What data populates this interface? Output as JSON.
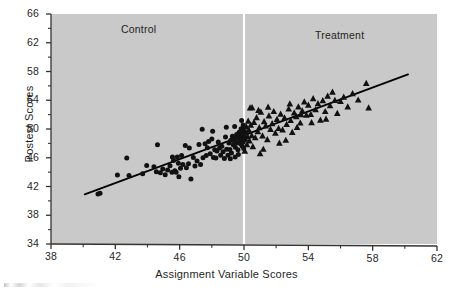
{
  "chart_data": {
    "type": "scatter",
    "title": "",
    "xlabel": "Assignment Variable Scores",
    "ylabel": "Postest Scores",
    "xlim": [
      38,
      62
    ],
    "ylim": [
      34,
      66
    ],
    "xticks": [
      38,
      42,
      46,
      50,
      54,
      58,
      62
    ],
    "yticks": [
      34,
      38,
      42,
      46,
      50,
      54,
      58,
      62,
      66
    ],
    "xtick_labels": [
      "38",
      "42",
      "46",
      "50",
      "54",
      "58",
      "62"
    ],
    "ytick_labels": [
      "34",
      "38",
      "42",
      "46",
      "50",
      "54",
      "58",
      "62",
      "66"
    ],
    "grid": false,
    "legend": "none",
    "plot_background": "#c9c9c9",
    "marker_color": "#111111",
    "line_color": "#000000",
    "cutoff_line_color": "#ffffff",
    "annotations": [
      {
        "text": "Control",
        "x": 44.1,
        "y": 64.6,
        "name": "control-group-label"
      },
      {
        "text": "Treatment",
        "x": 56.0,
        "y": 63.8,
        "name": "treatment-group-label"
      }
    ],
    "cutoff": {
      "x": 50,
      "label": "",
      "style": "vertical-white-line"
    },
    "fit_line": {
      "name": "regression-line",
      "x_start": 40.1,
      "y_start": 40.9,
      "x_end": 60.2,
      "y_end": 57.6,
      "slope": 0.83,
      "intercept": 7.6
    },
    "series": [
      {
        "name": "Control",
        "marker": "circle",
        "color": "#111111",
        "points": [
          [
            40.92,
            40.96
          ],
          [
            41.05,
            41.06
          ],
          [
            42.13,
            43.6
          ],
          [
            42.71,
            45.96
          ],
          [
            42.85,
            43.52
          ],
          [
            43.7,
            43.78
          ],
          [
            44.55,
            44.05
          ],
          [
            44.62,
            47.8
          ],
          [
            44.8,
            43.9
          ],
          [
            44.95,
            44.45
          ],
          [
            45.1,
            43.65
          ],
          [
            45.25,
            44.3
          ],
          [
            45.4,
            44.88
          ],
          [
            45.52,
            43.98
          ],
          [
            45.55,
            46.12
          ],
          [
            45.62,
            45.62
          ],
          [
            45.7,
            44.2
          ],
          [
            45.78,
            44.0
          ],
          [
            45.85,
            46.1
          ],
          [
            45.92,
            45.25
          ],
          [
            46.05,
            44.55
          ],
          [
            46.12,
            46.3
          ],
          [
            46.2,
            45.05
          ],
          [
            46.35,
            47.7
          ],
          [
            46.42,
            44.62
          ],
          [
            46.55,
            45.15
          ],
          [
            46.7,
            43.05
          ],
          [
            46.85,
            46.05
          ],
          [
            46.95,
            44.85
          ],
          [
            47.08,
            45.55
          ],
          [
            47.2,
            47.85
          ],
          [
            47.3,
            45.05
          ],
          [
            47.45,
            46.0
          ],
          [
            47.58,
            47.95
          ],
          [
            47.65,
            46.3
          ],
          [
            47.72,
            47.4
          ],
          [
            47.8,
            48.25
          ],
          [
            47.9,
            46.55
          ],
          [
            48.0,
            48.6
          ],
          [
            48.1,
            46.05
          ],
          [
            48.18,
            47.1
          ],
          [
            48.25,
            45.95
          ],
          [
            48.32,
            46.95
          ],
          [
            48.4,
            48.2
          ],
          [
            48.48,
            47.35
          ],
          [
            48.55,
            46.35
          ],
          [
            48.62,
            47.6
          ],
          [
            48.7,
            46.85
          ],
          [
            48.78,
            45.9
          ],
          [
            48.85,
            48.9
          ],
          [
            48.92,
            47.2
          ],
          [
            49.0,
            46.35
          ],
          [
            49.06,
            48.05
          ],
          [
            49.12,
            47.15
          ],
          [
            49.18,
            48.45
          ],
          [
            49.22,
            46.65
          ],
          [
            49.28,
            49.0
          ],
          [
            49.33,
            47.8
          ],
          [
            49.38,
            48.4
          ],
          [
            49.42,
            50.35
          ],
          [
            49.46,
            47.45
          ],
          [
            49.5,
            48.7
          ],
          [
            49.54,
            49.25
          ],
          [
            49.58,
            48.1
          ],
          [
            49.62,
            47.1
          ],
          [
            49.66,
            48.85
          ],
          [
            49.7,
            49.55
          ],
          [
            49.74,
            48.3
          ],
          [
            49.78,
            47.95
          ],
          [
            49.8,
            49.05
          ],
          [
            49.82,
            50.05
          ],
          [
            49.84,
            48.55
          ],
          [
            49.86,
            49.4
          ],
          [
            49.88,
            47.65
          ],
          [
            49.9,
            48.95
          ],
          [
            49.92,
            49.8
          ],
          [
            49.94,
            48.15
          ],
          [
            49.95,
            50.55
          ],
          [
            49.96,
            49.15
          ],
          [
            49.97,
            48.45
          ],
          [
            49.98,
            49.65
          ],
          [
            49.98,
            47.3
          ],
          [
            49.99,
            50.2
          ],
          [
            49.99,
            48.75
          ],
          [
            49.99,
            49.35
          ],
          [
            47.4,
            49.95
          ],
          [
            48.05,
            49.7
          ],
          [
            48.9,
            50.25
          ],
          [
            49.15,
            45.85
          ],
          [
            49.45,
            46.1
          ],
          [
            49.65,
            46.45
          ],
          [
            49.85,
            51.2
          ],
          [
            46.6,
            47.35
          ],
          [
            45.95,
            43.35
          ],
          [
            44.4,
            44.75
          ],
          [
            43.95,
            44.92
          ]
        ]
      },
      {
        "name": "Treatment",
        "marker": "triangle",
        "color": "#111111",
        "points": [
          [
            50.05,
            46.95
          ],
          [
            50.08,
            48.6
          ],
          [
            50.12,
            49.5
          ],
          [
            50.15,
            50.3
          ],
          [
            50.18,
            47.85
          ],
          [
            50.22,
            48.95
          ],
          [
            50.26,
            51.1
          ],
          [
            50.3,
            49.85
          ],
          [
            50.34,
            48.35
          ],
          [
            50.38,
            52.95
          ],
          [
            50.42,
            50.55
          ],
          [
            50.48,
            49.1
          ],
          [
            50.55,
            47.55
          ],
          [
            50.62,
            50.95
          ],
          [
            50.7,
            48.8
          ],
          [
            50.78,
            51.6
          ],
          [
            50.86,
            49.65
          ],
          [
            50.95,
            50.2
          ],
          [
            51.05,
            52.35
          ],
          [
            51.15,
            49.05
          ],
          [
            51.25,
            51.05
          ],
          [
            51.35,
            50.45
          ],
          [
            51.45,
            48.55
          ],
          [
            51.55,
            51.85
          ],
          [
            51.65,
            49.95
          ],
          [
            51.75,
            50.75
          ],
          [
            51.85,
            52.45
          ],
          [
            51.95,
            49.45
          ],
          [
            52.05,
            51.35
          ],
          [
            52.15,
            50.1
          ],
          [
            52.28,
            52.1
          ],
          [
            52.4,
            49.9
          ],
          [
            52.52,
            51.55
          ],
          [
            52.65,
            50.65
          ],
          [
            52.78,
            52.8
          ],
          [
            52.9,
            51.2
          ],
          [
            53.0,
            49.55
          ],
          [
            53.12,
            52.25
          ],
          [
            53.25,
            51.75
          ],
          [
            53.38,
            53.1
          ],
          [
            53.5,
            50.85
          ],
          [
            53.62,
            52.55
          ],
          [
            53.75,
            53.8
          ],
          [
            53.88,
            51.95
          ],
          [
            54.0,
            53.35
          ],
          [
            54.15,
            52.05
          ],
          [
            54.3,
            54.25
          ],
          [
            54.45,
            52.7
          ],
          [
            54.6,
            53.55
          ],
          [
            54.75,
            51.25
          ],
          [
            54.9,
            53.95
          ],
          [
            55.05,
            52.45
          ],
          [
            55.2,
            54.6
          ],
          [
            55.35,
            53.25
          ],
          [
            55.5,
            55.15
          ],
          [
            55.65,
            54.0
          ],
          [
            55.8,
            52.2
          ],
          [
            56.0,
            53.85
          ],
          [
            56.2,
            54.45
          ],
          [
            56.45,
            53.1
          ],
          [
            56.75,
            54.95
          ],
          [
            57.1,
            54.05
          ],
          [
            57.6,
            56.35
          ],
          [
            57.75,
            52.95
          ],
          [
            52.2,
            48.05
          ],
          [
            51.2,
            47.2
          ],
          [
            50.9,
            52.6
          ],
          [
            51.5,
            53.05
          ],
          [
            53.3,
            50.25
          ],
          [
            54.2,
            50.9
          ],
          [
            55.1,
            51.4
          ],
          [
            52.6,
            48.45
          ],
          [
            50.5,
            53.0
          ],
          [
            51.0,
            46.6
          ],
          [
            52.85,
            53.5
          ],
          [
            53.55,
            52.0
          ]
        ]
      }
    ]
  },
  "axis": {
    "x_label": "Assignment Variable Scores",
    "y_label": "Postest Scores"
  }
}
